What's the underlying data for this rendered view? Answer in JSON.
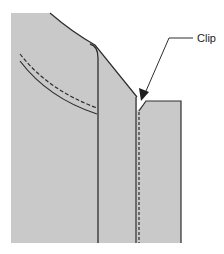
{
  "diagram": {
    "title": "",
    "labels": {
      "clip": "Clip"
    },
    "colors": {
      "fill": "#c9c9c9",
      "line": "#2e2e2e",
      "background": "#ffffff",
      "text": "#222222"
    },
    "parts": [
      {
        "name": "left-garment-panel",
        "description": "Gray panel with curved shoulder edge"
      },
      {
        "name": "pocket-stitch-dashed",
        "description": "Dashed curved stitch line"
      },
      {
        "name": "pocket-edge-solid",
        "description": "Solid curved pocket edge"
      },
      {
        "name": "inner-seam-line",
        "description": "Solid vertical seam"
      },
      {
        "name": "clip-seam-dashed",
        "description": "Dashed vertical seam at clip"
      },
      {
        "name": "right-garment-panel",
        "description": "Right rectangular panel with notch"
      },
      {
        "name": "clip-arrow",
        "description": "Leader line with arrow pointing to clip notch"
      }
    ]
  }
}
